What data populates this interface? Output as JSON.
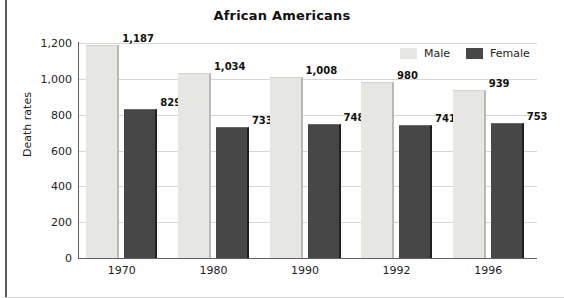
{
  "chart_data": {
    "type": "bar",
    "title": "African Americans",
    "xlabel": "",
    "ylabel": "Death rates",
    "categories": [
      "1970",
      "1980",
      "1990",
      "1992",
      "1996"
    ],
    "series": [
      {
        "name": "Male",
        "color": "#e6e6e3",
        "values": [
          1187,
          1034,
          1008,
          980,
          939
        ]
      },
      {
        "name": "Female",
        "color": "#474747",
        "values": [
          829,
          733,
          748,
          741,
          753
        ]
      }
    ],
    "value_labels": [
      [
        "1,187",
        "1,034",
        "1,008",
        "980",
        "939"
      ],
      [
        "829",
        "733",
        "748",
        "741",
        "753"
      ]
    ],
    "ylim": [
      0,
      1200
    ],
    "yticks": [
      0,
      200,
      400,
      600,
      800,
      1000,
      1200
    ],
    "ytick_labels": [
      "0",
      "200",
      "400",
      "600",
      "800",
      "1,000",
      "1,200"
    ],
    "grid": "horizontal",
    "legend_position": "top-right"
  }
}
